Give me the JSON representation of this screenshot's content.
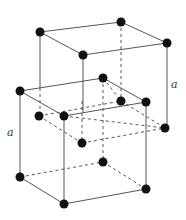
{
  "diagram": {
    "labels": [
      {
        "id": "a-right",
        "text": "a",
        "x": 171,
        "y": 78
      },
      {
        "id": "a-left",
        "text": "a",
        "x": 7,
        "y": 126
      }
    ],
    "atoms": [
      {
        "id": "upper-top-back-left",
        "x": 40,
        "y": 32
      },
      {
        "id": "upper-top-back-right",
        "x": 121,
        "y": 22
      },
      {
        "id": "upper-top-front-left",
        "x": 83,
        "y": 55
      },
      {
        "id": "upper-top-front-right",
        "x": 167,
        "y": 43
      },
      {
        "id": "mid-back-left",
        "x": 20,
        "y": 91
      },
      {
        "id": "mid-back-right",
        "x": 103,
        "y": 78
      },
      {
        "id": "mid-inner-left",
        "x": 39,
        "y": 116
      },
      {
        "id": "mid-front-left",
        "x": 64,
        "y": 116
      },
      {
        "id": "mid-inner-right",
        "x": 121,
        "y": 101
      },
      {
        "id": "mid-front-right",
        "x": 146,
        "y": 102
      },
      {
        "id": "mid-far-right",
        "x": 165,
        "y": 128
      },
      {
        "id": "mid-inner-center",
        "x": 82,
        "y": 143
      },
      {
        "id": "bottom-back-right",
        "x": 103,
        "y": 162
      },
      {
        "id": "bottom-back-left",
        "x": 20,
        "y": 177
      },
      {
        "id": "bottom-front-left",
        "x": 64,
        "y": 204
      },
      {
        "id": "bottom-front-right",
        "x": 146,
        "y": 189
      }
    ],
    "colors": {
      "atom": "#111111",
      "edge": "#555555",
      "background": "#ffffff"
    }
  }
}
